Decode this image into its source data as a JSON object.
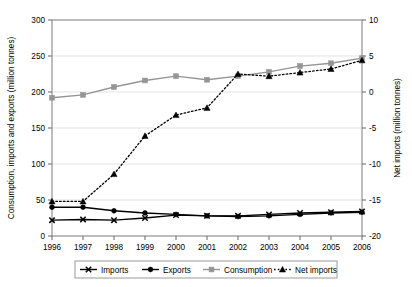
{
  "chart_data": {
    "type": "line",
    "title": "",
    "xlabel": "",
    "ylabel": "Consumption, imports and exports (million tonnes)",
    "y2label": "Net imports (million tonnes)",
    "categories": [
      "1996",
      "1997",
      "1998",
      "1999",
      "2000",
      "2001",
      "2002",
      "2003",
      "2004",
      "2005",
      "2006"
    ],
    "ylim": [
      0,
      300
    ],
    "yticks": [
      "0",
      "50",
      "100",
      "150",
      "200",
      "250",
      "300"
    ],
    "y2lim": [
      -20,
      10
    ],
    "y2ticks": [
      "-20",
      "-15",
      "-10",
      "-5",
      "0",
      "5",
      "10"
    ],
    "grid": true,
    "legend_position": "bottom",
    "series": [
      {
        "name": "Imports",
        "axis": "left",
        "marker": "x",
        "color": "#000000",
        "dash": "solid",
        "values": [
          22,
          23,
          22,
          25,
          29,
          28,
          28,
          30,
          32,
          33,
          34
        ]
      },
      {
        "name": "Exports",
        "axis": "left",
        "marker": "circle-filled",
        "color": "#000000",
        "dash": "solid",
        "values": [
          40,
          40,
          35,
          32,
          30,
          28,
          27,
          28,
          30,
          32,
          33
        ]
      },
      {
        "name": "Consumption",
        "axis": "left",
        "marker": "square-filled",
        "color": "#959595",
        "dash": "solid",
        "values": [
          192,
          196,
          207,
          216,
          222,
          217,
          222,
          228,
          236,
          240,
          247
        ]
      },
      {
        "name": "Net imports",
        "axis": "right",
        "marker": "triangle-filled",
        "color": "#000000",
        "dash": "dotted",
        "values": [
          -15.2,
          -15.2,
          -11.4,
          -6.1,
          -3.2,
          -2.2,
          2.5,
          2.2,
          2.7,
          3.2,
          4.4
        ]
      }
    ]
  },
  "legend": {
    "items": [
      {
        "label": "Imports"
      },
      {
        "label": "Exports"
      },
      {
        "label": "Consumption"
      },
      {
        "label": "Net imports"
      }
    ]
  },
  "axes": {
    "left_title": "Consumption, imports and exports (million tonnes)",
    "right_title": "Net imports (million tonnes)"
  }
}
